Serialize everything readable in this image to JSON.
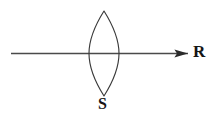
{
  "figure": {
    "background_color": "#ffffff",
    "stroke_color": "#3a3a3a",
    "text_color": "#151515",
    "width": 215,
    "height": 121
  },
  "labels": {
    "lens_label": "S",
    "ray_label": "R"
  },
  "elements": {
    "lens": {
      "name": "biconvex-lens",
      "shape": "vesica",
      "center_x": 104,
      "center_y": 53.5,
      "half_width": 15,
      "half_height": 42,
      "top_tip_y": 11,
      "bottom_tip_y": 96,
      "left_edge_x": 89,
      "right_edge_x": 119,
      "stroke_width": 1.1
    },
    "ray": {
      "name": "horizontal-ray",
      "start_x": 11,
      "end_x": 188,
      "y": 53.5,
      "stroke_width": 1.3,
      "arrowhead": {
        "tip_x": 188,
        "base_x": 174,
        "half_height": 4.2
      }
    }
  },
  "annotations": {
    "lens_label_x": 104,
    "lens_label_y": 105,
    "ray_label_x": 199,
    "ray_label_y": 53
  }
}
